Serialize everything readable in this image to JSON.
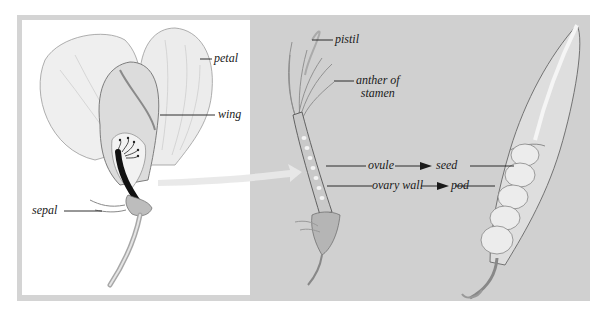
{
  "diagram": {
    "panels": [
      {
        "name": "flower",
        "labels": [
          "petal",
          "wing",
          "sepal"
        ]
      },
      {
        "name": "pistil-and-stamens",
        "labels": [
          "pistil",
          "anther of stamen",
          "ovule",
          "ovary wall"
        ]
      },
      {
        "name": "pea-pod",
        "labels": [
          "seed",
          "pod"
        ]
      }
    ],
    "relations": [
      {
        "from": "ovule",
        "to": "seed"
      },
      {
        "from": "ovary wall",
        "to": "pod"
      }
    ]
  },
  "labels": {
    "petal": "petal",
    "wing": "wing",
    "sepal": "sepal",
    "pistil": "pistil",
    "anther_line1": "anther of",
    "anther_line2": "stamen",
    "ovule": "ovule",
    "seed": "seed",
    "ovary_wall": "ovary wall",
    "pod": "pod"
  },
  "colors": {
    "frame": "#d4d4d4",
    "left_panel": "#ffffff",
    "right_panel": "#d0d0d0",
    "ink": "#1a1a1a"
  }
}
